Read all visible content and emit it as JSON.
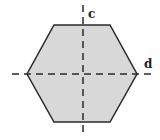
{
  "diagram": {
    "shape": "hexagon",
    "fill_color": "#d8d8d8",
    "stroke_color": "#2a2a2a",
    "vertices": [
      [
        54,
        25
      ],
      [
        110,
        25
      ],
      [
        137,
        74
      ],
      [
        110,
        122
      ],
      [
        54,
        122
      ],
      [
        27,
        74
      ]
    ],
    "axes": [
      {
        "name": "c",
        "orientation": "vertical",
        "x": 83,
        "y1": 5,
        "y2": 136,
        "style": "dashed"
      },
      {
        "name": "d",
        "orientation": "horizontal",
        "y": 74,
        "x1": 12,
        "x2": 155,
        "style": "dashed"
      }
    ],
    "labels": {
      "c": "c",
      "d": "d"
    }
  }
}
